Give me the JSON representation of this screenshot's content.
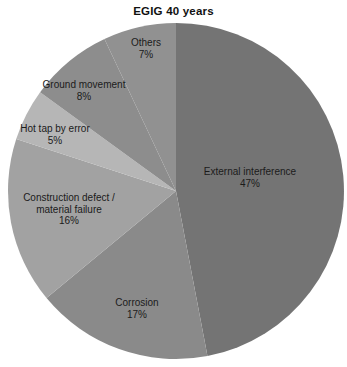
{
  "title": "EGIG 40 years",
  "chart_data": {
    "type": "pie",
    "title": "EGIG 40 years",
    "direction": "clockwise",
    "start_angle_deg": 0,
    "legend": "none",
    "background": "#ffffff",
    "geometry": {
      "cx": 176,
      "cy": 191,
      "r": 168
    },
    "slices": [
      {
        "label": "External interference",
        "value_pct": 47,
        "pct_text": "47%",
        "label_lines": [
          "External interference"
        ],
        "color": "#747474",
        "label_pos": {
          "x": 250,
          "y": 177
        }
      },
      {
        "label": "Corrosion",
        "value_pct": 17,
        "pct_text": "17%",
        "label_lines": [
          "Corrosion"
        ],
        "color": "#8a8a8a",
        "label_pos": {
          "x": 137,
          "y": 308
        }
      },
      {
        "label": "Construction defect / material failure",
        "value_pct": 16,
        "pct_text": "16%",
        "label_lines": [
          "Construction defect /",
          "material failure"
        ],
        "color": "#a2a2a2",
        "label_pos": {
          "x": 69,
          "y": 209
        }
      },
      {
        "label": "Hot tap by error",
        "value_pct": 5,
        "pct_text": "5%",
        "label_lines": [
          "Hot tap by error"
        ],
        "color": "#b6b6b6",
        "label_pos": {
          "x": 55,
          "y": 134
        }
      },
      {
        "label": "Ground movement",
        "value_pct": 8,
        "pct_text": "8%",
        "label_lines": [
          "Ground movement"
        ],
        "color": "#8d8d8d",
        "label_pos": {
          "x": 84,
          "y": 90
        }
      },
      {
        "label": "Others",
        "value_pct": 7,
        "pct_text": "7%",
        "label_lines": [
          "Others"
        ],
        "color": "#919191",
        "label_pos": {
          "x": 146,
          "y": 48
        }
      }
    ]
  }
}
